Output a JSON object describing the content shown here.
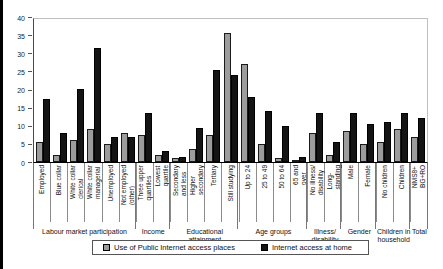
{
  "chart_data": {
    "type": "bar",
    "ylim": [
      0,
      40
    ],
    "yticks": [
      0,
      5,
      10,
      15,
      20,
      25,
      30,
      35,
      40
    ],
    "grid": false,
    "legend_position": "bottom",
    "series": [
      {
        "name": "Use of Public Internet access places",
        "color": "#9c9c9c",
        "values": [
          5.5,
          2,
          6,
          9,
          5,
          8,
          7.5,
          2,
          1,
          3.5,
          7.5,
          35.5,
          27,
          5,
          1,
          0.5,
          8,
          2,
          8.5,
          5,
          5.5,
          9,
          7
        ]
      },
      {
        "name": "Internet access at home",
        "color": "#141414",
        "values": [
          17.5,
          8,
          20,
          31.5,
          7,
          7,
          13.5,
          3,
          1.5,
          9.5,
          25.5,
          24,
          18,
          14,
          10,
          1.5,
          13.5,
          5.5,
          13.5,
          10.5,
          11,
          13.5,
          12
        ]
      }
    ],
    "groups": [
      {
        "label": "Labour market participation",
        "categories": [
          "Employed",
          "Blue collar",
          "White collar\nclerical",
          "White collar\nmanagerial",
          "Unemployed",
          "Not employed\n(other)"
        ]
      },
      {
        "label": "Income",
        "categories": [
          "Three upper\nquartiles",
          "Lowest\nquartile"
        ]
      },
      {
        "label": "Educational\nattainment",
        "categories": [
          "Secondary\nand less",
          "Higher\nsecondary",
          "Tertiary",
          "Still studying"
        ]
      },
      {
        "label": "Age groups",
        "categories": [
          "Up to 24",
          "25 to 49",
          "50 to 64",
          "65 and\nover"
        ]
      },
      {
        "label": "Illness/\ndisability",
        "categories": [
          "No illness/\ndisability",
          "Long-\nstanding"
        ]
      },
      {
        "label": "Gender",
        "categories": [
          "Male",
          "Female"
        ]
      },
      {
        "label": "Children in\nhousehold",
        "categories": [
          "No children",
          "Children"
        ]
      },
      {
        "label": "Total",
        "categories": [
          "NMS8+\nBG+RO"
        ]
      }
    ]
  }
}
